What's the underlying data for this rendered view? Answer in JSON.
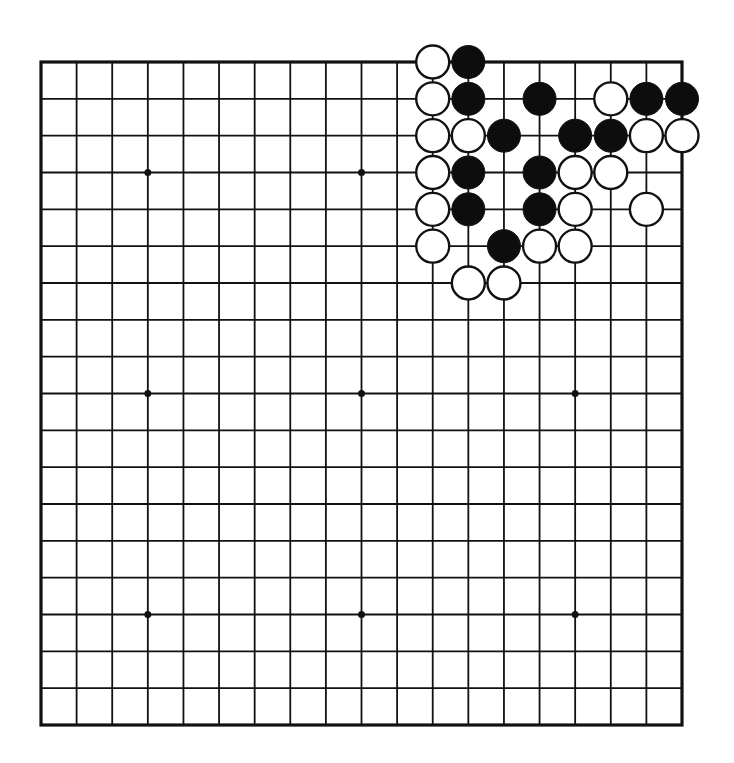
{
  "diagram": {
    "type": "go-board",
    "size": 19,
    "colors": {
      "background": "#ffffff",
      "line": "#111111",
      "black_stone": "#0d0d0d",
      "white_stone": "#ffffff",
      "stone_outline": "#111111"
    },
    "geometry": {
      "left": 41,
      "top": 62,
      "right": 682,
      "bottom": 725,
      "stone_radius": 16.5,
      "hoshi_radius": 3.5,
      "edge_width": 3.2,
      "line_width": 1.8
    },
    "hoshi": [
      [
        3,
        3
      ],
      [
        3,
        9
      ],
      [
        3,
        15
      ],
      [
        9,
        3
      ],
      [
        9,
        9
      ],
      [
        9,
        15
      ],
      [
        15,
        3
      ],
      [
        15,
        9
      ],
      [
        15,
        15
      ]
    ],
    "stones": [
      {
        "row": 0,
        "col": 11,
        "color": "white"
      },
      {
        "row": 0,
        "col": 12,
        "color": "black"
      },
      {
        "row": 1,
        "col": 11,
        "color": "white"
      },
      {
        "row": 1,
        "col": 12,
        "color": "black"
      },
      {
        "row": 1,
        "col": 14,
        "color": "black"
      },
      {
        "row": 1,
        "col": 16,
        "color": "white"
      },
      {
        "row": 1,
        "col": 17,
        "color": "black"
      },
      {
        "row": 1,
        "col": 18,
        "color": "black"
      },
      {
        "row": 2,
        "col": 11,
        "color": "white"
      },
      {
        "row": 2,
        "col": 12,
        "color": "white"
      },
      {
        "row": 2,
        "col": 13,
        "color": "black"
      },
      {
        "row": 2,
        "col": 15,
        "color": "black"
      },
      {
        "row": 2,
        "col": 16,
        "color": "black"
      },
      {
        "row": 2,
        "col": 17,
        "color": "white"
      },
      {
        "row": 2,
        "col": 18,
        "color": "white"
      },
      {
        "row": 3,
        "col": 11,
        "color": "white"
      },
      {
        "row": 3,
        "col": 12,
        "color": "black"
      },
      {
        "row": 3,
        "col": 14,
        "color": "black"
      },
      {
        "row": 3,
        "col": 15,
        "color": "white"
      },
      {
        "row": 3,
        "col": 16,
        "color": "white"
      },
      {
        "row": 4,
        "col": 11,
        "color": "white"
      },
      {
        "row": 4,
        "col": 12,
        "color": "black"
      },
      {
        "row": 4,
        "col": 14,
        "color": "black"
      },
      {
        "row": 4,
        "col": 15,
        "color": "white"
      },
      {
        "row": 4,
        "col": 17,
        "color": "white"
      },
      {
        "row": 5,
        "col": 11,
        "color": "white"
      },
      {
        "row": 5,
        "col": 13,
        "color": "black"
      },
      {
        "row": 5,
        "col": 14,
        "color": "white"
      },
      {
        "row": 5,
        "col": 15,
        "color": "white"
      },
      {
        "row": 6,
        "col": 12,
        "color": "white"
      },
      {
        "row": 6,
        "col": 13,
        "color": "white"
      }
    ],
    "stone_counts": {
      "black": 13,
      "white": 18
    }
  }
}
